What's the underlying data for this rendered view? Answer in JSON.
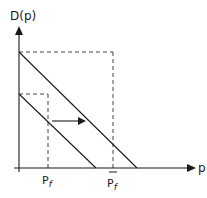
{
  "diagram": {
    "y_axis_label": "D(p)",
    "x_axis_label": "p",
    "tick_labels": [
      {
        "base": "P",
        "sub": "f",
        "position": "left"
      },
      {
        "base": "P",
        "sub": "f",
        "position": "right",
        "overbar": true
      }
    ],
    "lines": [
      {
        "name": "demand-curve-original",
        "from": [
          19,
          94
        ],
        "to": [
          96,
          168
        ]
      },
      {
        "name": "demand-curve-shifted",
        "from": [
          19,
          52
        ],
        "to": [
          137,
          168
        ]
      }
    ],
    "shift_arrow": {
      "direction": "right"
    },
    "colors": {
      "line": "#1a1a1a",
      "dashed": "#444444",
      "background": "#ffffff"
    }
  }
}
